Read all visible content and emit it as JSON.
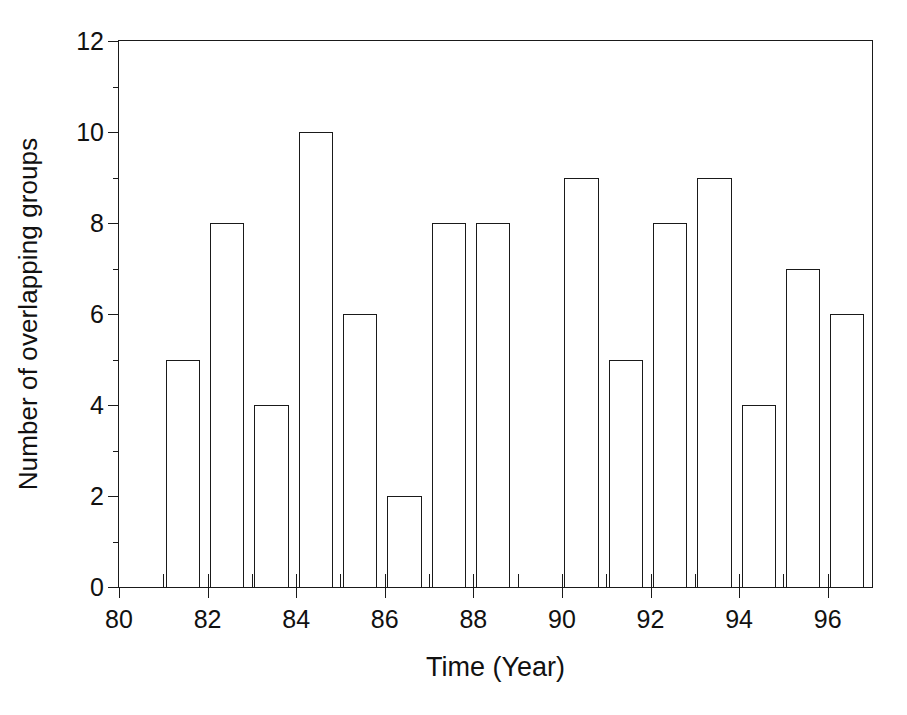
{
  "chart_data": {
    "type": "bar",
    "title": "",
    "xlabel": "Time (Year)",
    "ylabel": "Number of overlapping groups",
    "categories": [
      "81",
      "82",
      "83",
      "84",
      "85",
      "86",
      "87",
      "88",
      "89",
      "90",
      "91",
      "92",
      "93",
      "94",
      "95",
      "96"
    ],
    "values": [
      5,
      8,
      4,
      10,
      6,
      2,
      8,
      8,
      0,
      9,
      5,
      8,
      9,
      4,
      7,
      6
    ],
    "x": [
      81,
      82,
      83,
      84,
      85,
      86,
      87,
      88,
      89,
      90,
      91,
      92,
      93,
      94,
      95,
      96
    ],
    "xlim": [
      80,
      97
    ],
    "ylim": [
      0,
      12
    ],
    "y_ticks": [
      0,
      2,
      4,
      6,
      8,
      10,
      12
    ],
    "y_tick_labels": [
      "0",
      "2",
      "4",
      "6",
      "8",
      "10",
      "12"
    ],
    "y_minor_ticks": [
      1,
      3,
      5,
      7,
      9,
      11
    ],
    "x_ticks": [
      80,
      82,
      84,
      86,
      88,
      90,
      92,
      94,
      96
    ],
    "x_tick_labels": [
      "80",
      "82",
      "84",
      "86",
      "88",
      "90",
      "92",
      "94",
      "96"
    ],
    "x_minor_ticks": [
      81,
      82,
      83,
      84,
      85,
      86,
      87,
      88,
      89,
      90,
      91,
      92,
      93,
      94,
      95,
      96
    ],
    "grid": false,
    "legend": null,
    "bar_fill": "#ffffff",
    "bar_edge": "#1a1a1a",
    "axis_color": "#1a1a1a",
    "background": "#ffffff"
  },
  "figure": {
    "caption_fragment": ""
  }
}
